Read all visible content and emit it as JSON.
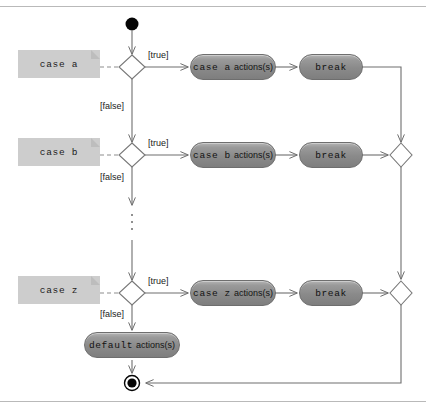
{
  "diagram": {
    "kind": "activity-diagram",
    "colors": {
      "note_fill": "#cdcdcd",
      "note_fold": "#bdbdbd",
      "action_fill": "#8a8a8a",
      "action_border": "#6e6e6e",
      "decision_fill": "#ffffff",
      "decision_border": "#777777",
      "edge": "#6e6e6e",
      "node_terminal": "#000000",
      "frame_rule": "#b9b9b9",
      "text": "#1b1b1b"
    },
    "frame": {
      "top_rule": "horizontal-rule",
      "bottom_rule": "horizontal-rule"
    },
    "nodes": {
      "initial": "initial-node",
      "final": "final-node"
    },
    "notes": [
      {
        "label": "case a"
      },
      {
        "label": "case b"
      },
      {
        "label": "case z"
      }
    ],
    "decisions": [
      {
        "true_label": "[true]",
        "false_label": "[false]"
      },
      {
        "true_label": "[true]",
        "false_label": "[false]"
      },
      {
        "true_label": "[true]",
        "false_label": "[false]"
      }
    ],
    "branches": [
      {
        "action_keyword": "case a",
        "action_suffix": "actions(s)",
        "break_label": "break"
      },
      {
        "action_keyword": "case b",
        "action_suffix": "actions(s)",
        "break_label": "break"
      },
      {
        "action_keyword": "case z",
        "action_suffix": "actions(s)",
        "break_label": "break"
      }
    ],
    "default_branch": {
      "action_keyword": "default",
      "action_suffix": "actions(s)"
    },
    "continuation": {
      "symbol": "vertical-ellipsis",
      "dots": 3
    },
    "merges": [
      {
        "name": "merge-upper"
      },
      {
        "name": "merge-lower"
      }
    ]
  }
}
